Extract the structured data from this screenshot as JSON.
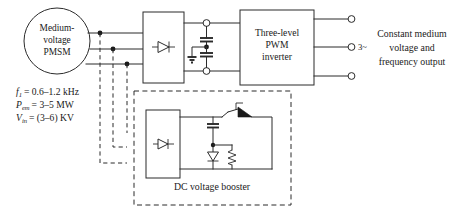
{
  "figure": {
    "background_color": "#ffffff",
    "line_color": "#2b2b2b"
  },
  "machine": {
    "name": "medium-voltage-pmsm",
    "line1": "Medium-",
    "line2": "voltage",
    "line3": "PMSM"
  },
  "parameters": [
    {
      "symbol": "f",
      "subscript": "1",
      "equals": "= 0.6–1.2 kHz",
      "full": "f1 = 0.6–1.2 kHz"
    },
    {
      "symbol": "P",
      "subscript": "em",
      "equals": "= 3–5 MW",
      "full": "Pem = 3–5 MW"
    },
    {
      "symbol": "V",
      "subscript": "in",
      "equals": "= (3–6) KV",
      "full": "Vin = (3–6) KV"
    }
  ],
  "rectifier": {
    "name": "main-diode-rectifier",
    "symbol": "diode"
  },
  "dc_link": {
    "name": "dc-link-capacitors",
    "capacitor_count": 2,
    "ground_symbol": "earth"
  },
  "inverter": {
    "name": "three-level-pwm-inverter",
    "line1": "Three-level",
    "line2": "PWM",
    "line3": "inverter"
  },
  "output": {
    "phase_label": "3~",
    "line1": "Constant medium",
    "line2": "voltage and",
    "line3": "frequency output",
    "terminal_count": 3
  },
  "booster": {
    "name": "dc-voltage-booster",
    "label": "DC voltage booster",
    "rectifier_symbol": "diode",
    "components": [
      "capacitor",
      "thyristor-switch",
      "diode",
      "resistor"
    ]
  }
}
